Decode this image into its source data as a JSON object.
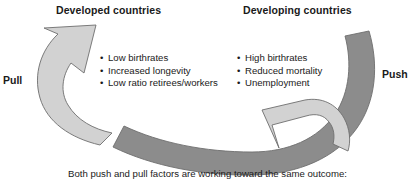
{
  "figure": {
    "type": "cyclic-push-pull-diagram",
    "width": 415,
    "height": 185,
    "background": "#ffffff"
  },
  "headings": {
    "developed": "Developed countries",
    "developing": "Developing countries"
  },
  "side_labels": {
    "pull": "Pull",
    "push": "Push"
  },
  "columns": {
    "developed": {
      "bullet_glyph": "•",
      "items": [
        "Low birthrates",
        "Increased longevity",
        "Low ratio retirees/workers"
      ]
    },
    "developing": {
      "bullet_glyph": "•",
      "items": [
        "High birthrates",
        "Reduced mortality",
        "Unemployment"
      ]
    }
  },
  "arrows": {
    "pull_arrow": {
      "name": "pull-arrow",
      "fill": "#d2d2d2",
      "stroke": "#6e6e6e",
      "direction": "curves-up-and-right",
      "label": "Pull"
    },
    "push_arrow": {
      "name": "push-arrow",
      "fill": "#d2d2d2",
      "stroke": "#6e6e6e",
      "direction": "curves-down-and-left",
      "label": "Push"
    },
    "dark_band": {
      "name": "dark-connecting-band",
      "fill": "#8c8c8c",
      "stroke": "#6e6e6e",
      "direction": "sweeps-from-upper-right-to-lower-left"
    }
  },
  "caption": "Both push and pull factors are working toward the same outcome:"
}
